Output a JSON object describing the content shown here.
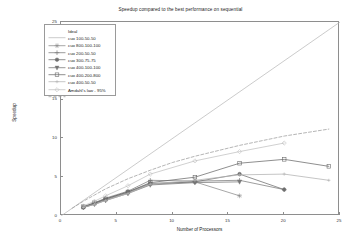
{
  "chart_data": {
    "type": "line",
    "title": "Speedup compared to the best performance on sequential",
    "xlabel": "Number of Processors",
    "ylabel": "Speedup",
    "xlim": [
      0,
      25
    ],
    "ylim": [
      0,
      25
    ],
    "xticks": [
      5,
      10,
      15,
      20,
      25
    ],
    "yticks": [
      5,
      10,
      15,
      20,
      25
    ],
    "grid": false,
    "legend_position": "upper left",
    "series": [
      {
        "name": "Ideal",
        "style": "solid",
        "marker": "none",
        "color": "#b9b9b9",
        "x": [
          0,
          25
        ],
        "y": [
          0,
          25
        ]
      },
      {
        "name": "cuo 100-50-50",
        "style": "solid",
        "marker": "star",
        "color": "#8a8a8a",
        "x": [
          2,
          3,
          4,
          6,
          8,
          12,
          16
        ],
        "y": [
          1.1,
          1.6,
          2.1,
          3.0,
          4.1,
          4.4,
          2.6
        ]
      },
      {
        "name": "cuo 800-100-100",
        "style": "solid",
        "marker": "plus",
        "color": "#7c7c7c",
        "x": [
          2,
          3,
          4,
          6,
          8,
          12,
          16,
          20
        ],
        "y": [
          1.2,
          1.7,
          2.3,
          3.2,
          4.6,
          4.5,
          4.6,
          3.4
        ]
      },
      {
        "name": "cuo 200-50-50",
        "style": "solid",
        "marker": "circle-filled",
        "color": "#6e6e6e",
        "x": [
          2,
          3,
          4,
          6,
          8,
          12,
          16,
          20
        ],
        "y": [
          1.1,
          1.6,
          2.2,
          3.1,
          4.2,
          4.4,
          5.4,
          3.4
        ]
      },
      {
        "name": "cuo 300-75-75",
        "style": "solid",
        "marker": "triangle-down",
        "color": "#767676",
        "x": [
          2,
          3,
          4,
          6,
          8,
          12,
          16
        ],
        "y": [
          1.1,
          1.5,
          2.0,
          2.9,
          4.0,
          4.3,
          4.4
        ]
      },
      {
        "name": "cuo 400-100-100",
        "style": "solid",
        "marker": "square",
        "color": "#6a6a6a",
        "x": [
          2,
          3,
          4,
          6,
          8,
          12,
          16,
          20,
          24
        ],
        "y": [
          1.2,
          1.7,
          2.2,
          3.1,
          4.3,
          5.0,
          6.8,
          7.3,
          6.4
        ]
      },
      {
        "name": "cuo 400-200-800",
        "style": "solid",
        "marker": "plus-small",
        "color": "#b2b2b2",
        "x": [
          2,
          3,
          4,
          6,
          8,
          12,
          16,
          20,
          24
        ],
        "y": [
          1.1,
          1.5,
          2.0,
          2.9,
          4.1,
          4.6,
          5.3,
          5.4,
          4.6
        ]
      },
      {
        "name": "cuo 400-50-50",
        "style": "solid",
        "marker": "diamond",
        "color": "#c0c0c0",
        "x": [
          2,
          3,
          4,
          6,
          8,
          12,
          16,
          20
        ],
        "y": [
          1.3,
          1.9,
          2.6,
          3.9,
          5.4,
          7.1,
          8.3,
          9.4
        ]
      },
      {
        "name": "Amdahl's law - 95%",
        "style": "dashed",
        "marker": "none",
        "color": "#9c9c9c",
        "x": [
          1,
          2,
          3,
          4,
          6,
          8,
          10,
          12,
          16,
          20,
          24
        ],
        "y": [
          1.0,
          1.9,
          2.7,
          3.5,
          4.8,
          5.9,
          6.9,
          7.7,
          9.1,
          10.3,
          11.2
        ]
      }
    ]
  }
}
